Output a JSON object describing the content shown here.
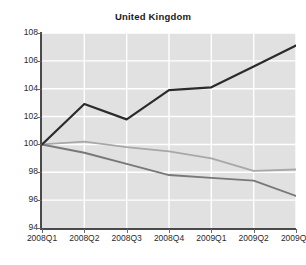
{
  "chart_data": {
    "type": "line",
    "title": "United Kingdom",
    "xlabel": "",
    "ylabel": "",
    "categories": [
      "2008Q1",
      "2008Q2",
      "2008Q3",
      "2008Q4",
      "2009Q1",
      "2009Q2",
      "2009Q3"
    ],
    "ylim": [
      94,
      108
    ],
    "yticks": [
      94,
      96,
      98,
      100,
      102,
      104,
      106,
      108
    ],
    "grid": true,
    "legend": "none",
    "series": [
      {
        "name": "series-black",
        "color": "#2b2b2b",
        "width": 2.2,
        "values": [
          100.0,
          102.9,
          101.8,
          103.9,
          104.1,
          105.6,
          107.1
        ]
      },
      {
        "name": "series-light-gray",
        "color": "#a8a8a8",
        "width": 1.8,
        "values": [
          100.0,
          100.2,
          99.8,
          99.5,
          99.0,
          98.1,
          98.2
        ]
      },
      {
        "name": "series-dark-gray",
        "color": "#787878",
        "width": 1.9,
        "values": [
          100.0,
          99.4,
          98.6,
          97.8,
          97.6,
          97.4,
          96.3
        ]
      }
    ],
    "plot_background": "#e1e1e1",
    "gridline_color": "#ffffff",
    "axis_color": "#4a4a4a"
  }
}
